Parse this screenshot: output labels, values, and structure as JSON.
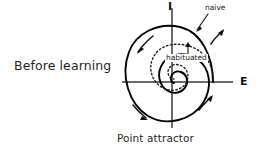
{
  "figure": {
    "condition_label": "Before learning",
    "caption": "Point attractor",
    "axes": {
      "vertical_label": "I",
      "horizontal_label": "E",
      "origin": {
        "x": 172,
        "y": 82
      },
      "vertical_extent": {
        "top": 8,
        "bottom": 128
      },
      "horizontal_extent": {
        "left": 122,
        "right": 233
      },
      "color": "#3a3a3a"
    },
    "trajectories": [
      {
        "name": "naive",
        "label": "naive",
        "style": "solid",
        "color": "#000000",
        "stroke_width": 1.8,
        "description": "large outer spiral converging counterclockwise to the origin point attractor"
      },
      {
        "name": "habituated",
        "label": "habituated",
        "style": "dotted",
        "color": "#1a1a1a",
        "stroke_width": 1.2,
        "description": "small inner dotted loop converging counterclockwise to the origin point attractor"
      }
    ],
    "flow_arrows": [
      {
        "name": "arrow-upper-left",
        "direction": "down-left",
        "x": 140,
        "y": 47
      },
      {
        "name": "arrow-upper-right",
        "direction": "up-right",
        "x": 216,
        "y": 34
      },
      {
        "name": "arrow-lower-left",
        "direction": "down-right",
        "x": 140,
        "y": 112
      },
      {
        "name": "arrow-lower-right",
        "direction": "up-right",
        "x": 206,
        "y": 100
      }
    ],
    "leader_line": {
      "name": "naive-leader",
      "from": {
        "x": 207,
        "y": 14
      },
      "to": {
        "x": 196,
        "y": 30
      }
    },
    "habituated_pointer": {
      "name": "habituated-pointer",
      "from": {
        "x": 188,
        "y": 54
      },
      "to": {
        "x": 188,
        "y": 44
      }
    },
    "colors": {
      "background": "#ffffff",
      "ink": "#1a1a1a",
      "axis": "#3a3a3a"
    }
  }
}
